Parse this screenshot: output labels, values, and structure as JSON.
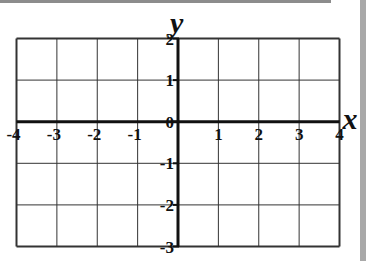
{
  "chart_data": {
    "type": "coordinate-grid",
    "title": "",
    "xlabel": "x",
    "ylabel": "y",
    "xlim": [
      -4,
      4
    ],
    "ylim": [
      -3,
      2
    ],
    "grid": true,
    "x_ticks": [
      -4,
      -3,
      -2,
      -1,
      1,
      2,
      3,
      4
    ],
    "x_tick_labels": [
      "-4",
      "-3",
      "-2",
      "-1",
      "1",
      "2",
      "3",
      "4"
    ],
    "y_ticks": [
      2,
      1,
      0,
      -1,
      -2,
      -3
    ],
    "y_tick_labels": [
      "2",
      "1",
      "0",
      "-1",
      "-2",
      "-3"
    ],
    "series": []
  },
  "colors": {
    "grid": "#333333",
    "axis": "#111111",
    "top_bar": "#8c8c8c",
    "right_strip": "#a9a9a9"
  }
}
